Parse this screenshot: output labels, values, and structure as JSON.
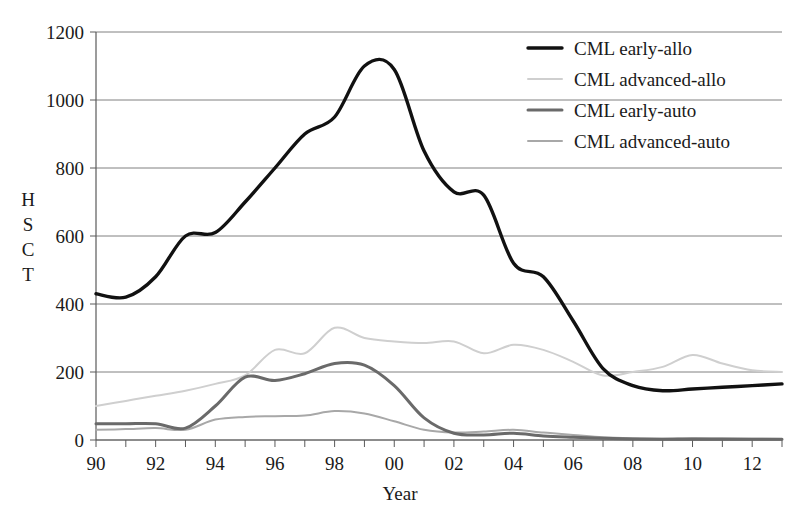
{
  "chart_data": {
    "type": "line",
    "title": "",
    "xlabel": "Year",
    "ylabel": "HSCT",
    "ylabel_chars": [
      "H",
      "S",
      "C",
      "T"
    ],
    "xlim": [
      90,
      113
    ],
    "ylim": [
      0,
      1200
    ],
    "grid": true,
    "legend_position": "top-right",
    "y_ticks": [
      0,
      200,
      400,
      600,
      800,
      1000,
      1200
    ],
    "y_tick_labels": [
      "0",
      "200",
      "400",
      "600",
      "800",
      "1000",
      "1200"
    ],
    "x_ticks": [
      90,
      91,
      92,
      93,
      94,
      95,
      96,
      97,
      98,
      99,
      100,
      101,
      102,
      103,
      104,
      105,
      106,
      107,
      108,
      109,
      110,
      111,
      112,
      113
    ],
    "x_tick_labels": [
      "90",
      "",
      "92",
      "",
      "94",
      "",
      "96",
      "",
      "98",
      "",
      "00",
      "",
      "02",
      "",
      "04",
      "",
      "06",
      "",
      "08",
      "",
      "10",
      "",
      "12",
      ""
    ],
    "x": [
      90,
      91,
      92,
      93,
      94,
      95,
      96,
      97,
      98,
      99,
      100,
      101,
      102,
      103,
      104,
      105,
      106,
      107,
      108,
      109,
      110,
      111,
      112,
      113
    ],
    "series": [
      {
        "name": "CML early-allo",
        "color": "#111111",
        "width": 3.4,
        "values": [
          430,
          420,
          480,
          600,
          610,
          700,
          800,
          900,
          950,
          1100,
          1090,
          850,
          730,
          720,
          520,
          480,
          350,
          210,
          160,
          145,
          150,
          155,
          160,
          165
        ]
      },
      {
        "name": "CML advanced-allo",
        "color": "#cfcfcf",
        "width": 2.0,
        "values": [
          100,
          115,
          130,
          145,
          165,
          190,
          265,
          255,
          330,
          300,
          290,
          285,
          290,
          255,
          280,
          265,
          230,
          190,
          200,
          215,
          250,
          225,
          205,
          200
        ]
      },
      {
        "name": "CML early-auto",
        "color": "#6a6a6a",
        "width": 3.0,
        "values": [
          48,
          48,
          48,
          35,
          100,
          185,
          175,
          195,
          225,
          220,
          160,
          65,
          20,
          15,
          20,
          12,
          8,
          5,
          3,
          2,
          2,
          2,
          2,
          2
        ]
      },
      {
        "name": "CML advanced-auto",
        "color": "#a8a8a8",
        "width": 2.0,
        "values": [
          30,
          32,
          35,
          30,
          60,
          68,
          70,
          72,
          85,
          78,
          55,
          30,
          22,
          25,
          30,
          22,
          15,
          8,
          5,
          4,
          6,
          5,
          4,
          3
        ]
      }
    ]
  },
  "legend": {
    "items": [
      {
        "label": "CML early-allo"
      },
      {
        "label": "CML advanced-allo"
      },
      {
        "label": "CML early-auto"
      },
      {
        "label": "CML advanced-auto"
      }
    ]
  }
}
